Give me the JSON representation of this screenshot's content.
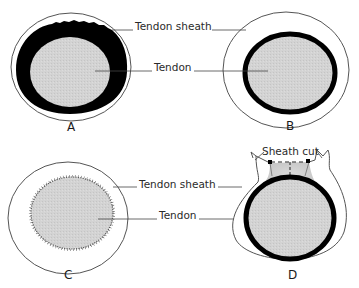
{
  "diagram": {
    "type": "anatomical cross-section",
    "colors": {
      "tendon_fill": "#d2d2d2",
      "black_ring": "#000000",
      "outline": "#555555",
      "background": "#ffffff"
    },
    "panels": [
      {
        "id": "A",
        "label": "A",
        "description": "Tendon surrounded by thick dark layer with irregular top edge inside sheath"
      },
      {
        "id": "B",
        "label": "B",
        "description": "Tendon with thinner dark ring inside wider sheath"
      },
      {
        "id": "C",
        "label": "C",
        "description": "Tendon with stitched/hatched border inside sheath"
      },
      {
        "id": "D",
        "label": "D",
        "description": "Sheath cut open at top, tendon with dark ring"
      }
    ],
    "labels": {
      "tendon_sheath_top": "Tendon sheath",
      "tendon_top": "Tendon",
      "sheath_cut": "Sheath cut",
      "tendon_sheath_bottom": "Tendon sheath",
      "tendon_bottom": "Tendon"
    }
  }
}
